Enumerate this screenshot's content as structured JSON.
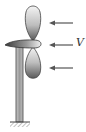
{
  "diagram": {
    "labels": {
      "velocity": "V"
    },
    "elements": {
      "upper_blade": "propeller blade (upper)",
      "lower_blade": "propeller blade (lower)",
      "hub": "nacelle / hub",
      "tower": "support pole",
      "ground": "fixed ground support (hatched)",
      "wind_arrows": 3
    },
    "colors": {
      "blade_light": "#f2f2f2",
      "blade_dark": "#555555",
      "outline": "#333333",
      "tower_fill": "#9a9a9a",
      "arrow": "#555555"
    }
  }
}
